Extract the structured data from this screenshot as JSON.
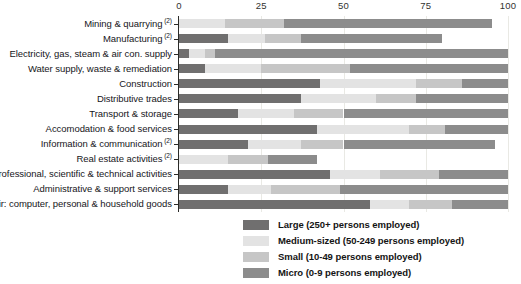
{
  "chart_data": {
    "type": "bar",
    "orientation": "horizontal",
    "stacked": true,
    "title": "",
    "subtitle": "",
    "xlabel": "",
    "ylabel": "",
    "xlim": [
      0,
      100
    ],
    "xticks": [
      0,
      25,
      50,
      75,
      100
    ],
    "xtick_labels": [
      "0",
      "25",
      "50",
      "75",
      "100"
    ],
    "grid": true,
    "grid_axis": "x",
    "legend_position": "bottom",
    "units": "percent",
    "categories": [
      "Mining & quarrying",
      "Manufacturing",
      "Electricity, gas, steam & air con. supply",
      "Water supply, waste & remediation",
      "Construction",
      "Distributive trades",
      "Transport & storage",
      "Accomodation & food services",
      "Information & communication",
      "Real estate activities",
      "Professional, scientific & technical activities",
      "Administrative & support services",
      "Repair: computer, personal & household goods"
    ],
    "category_footnotes": [
      "(2)",
      "(2)",
      "",
      "",
      "",
      "",
      "",
      "",
      "(2)",
      "(2)",
      "",
      "",
      ""
    ],
    "series": [
      {
        "name": "Large (250+ persons employed)",
        "color": "#706f6f",
        "values": [
          0,
          15,
          3,
          8,
          43,
          37,
          18,
          42,
          21,
          0,
          46,
          15,
          58
        ]
      },
      {
        "name": "Medium-sized (50-249 persons employed)",
        "color": "#e3e3e3",
        "values": [
          14,
          11,
          5,
          17,
          29,
          23,
          17,
          28,
          16,
          15,
          15,
          13,
          12
        ]
      },
      {
        "name": "Small (10-49 persons employed)",
        "color": "#c6c6c6",
        "values": [
          18,
          11,
          3,
          27,
          14,
          12,
          15,
          11,
          13,
          12,
          18,
          21,
          13
        ]
      },
      {
        "name": "Micro (0-9 persons employed)",
        "color": "#8c8c8c",
        "values": [
          63,
          43,
          89,
          48,
          14,
          28,
          50,
          19,
          46,
          15,
          21,
          51,
          17
        ]
      }
    ]
  },
  "legend": {
    "items": [
      {
        "label": "Large (250+ persons employed)",
        "color": "#706f6f"
      },
      {
        "label": "Medium-sized (50-249 persons employed)",
        "color": "#e3e3e3"
      },
      {
        "label": "Small (10-49 persons employed)",
        "color": "#c6c6c6"
      },
      {
        "label": "Micro (0-9 persons employed)",
        "color": "#8c8c8c"
      }
    ]
  }
}
